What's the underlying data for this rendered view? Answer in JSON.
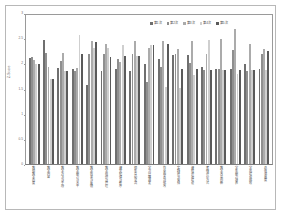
{
  "chart_data": {
    "type": "bar",
    "title": "",
    "subtitle": "",
    "xlabel": "",
    "ylabel": "Z-Score",
    "ylim": [
      0,
      3
    ],
    "yticks": [
      "0",
      "0.5",
      "1",
      "1.5",
      "2",
      "2.5",
      "3"
    ],
    "grid": false,
    "legend_position": "top-right",
    "series_colors": [
      "#6f6f6f",
      "#8f8f8f",
      "#ababab",
      "#cfcfcf",
      "#5a5a5a"
    ],
    "categories": [
      "教师教学态度",
      "教学内容",
      "教学方法与手段",
      "教学能力与水平",
      "教学效果与反馈",
      "教学组织与管理",
      "课堂纪律与秩序",
      "师生互动交流",
      "学习兴趣激发",
      "作业布置与批改",
      "实践环节安排",
      "课程资源建设",
      "考核评价方式",
      "教学改革创新",
      "学生能力培养",
      "学风建设成效",
      "总体满意度"
    ],
    "series": [
      {
        "name": "第1次",
        "values": [
          2.13,
          2.5,
          1.93,
          1.92,
          1.6,
          1.87,
          1.92,
          1.87,
          2.01,
          2.11,
          2.2,
          2.2,
          1.96,
          1.91,
          1.91,
          2.01,
          1.91
        ]
      },
      {
        "name": "第2次",
        "values": [
          2.16,
          2.24,
          2.07,
          1.87,
          2.21,
          2.21,
          2.12,
          2.21,
          1.66,
          1.96,
          2.21,
          2.04,
          1.9,
          1.91,
          2.29,
          1.88,
          2.22
        ]
      },
      {
        "name": "第3次",
        "values": [
          2.1,
          1.96,
          2.23,
          1.93,
          2.47,
          2.41,
          2.05,
          2.47,
          2.33,
          2.47,
          2.32,
          2.48,
          2.21,
          2.51,
          2.72,
          2.41,
          2.32
        ]
      },
      {
        "name": "第4次",
        "values": [
          2.01,
          1.71,
          1.88,
          2.59,
          2.34,
          2.34,
          2.39,
          2.17,
          2.39,
          1.56,
          1.54,
          1.8,
          2.5,
          1.9,
          1.81,
          1.9,
          1.9
        ]
      },
      {
        "name": "第5次",
        "values": [
          2.01,
          1.71,
          1.88,
          2.22,
          2.46,
          2.16,
          2.17,
          2.17,
          2.4,
          2.41,
          1.91,
          1.91,
          1.89,
          1.9,
          1.9,
          1.9,
          2.28
        ]
      }
    ]
  },
  "legend": {
    "items": [
      {
        "label": "第1次",
        "color": "#6f6f6f"
      },
      {
        "label": "第2次",
        "color": "#8f8f8f"
      },
      {
        "label": "第3次",
        "color": "#ababab"
      },
      {
        "label": "第4次",
        "color": "#cfcfcf"
      },
      {
        "label": "第5次",
        "color": "#5a5a5a"
      }
    ]
  },
  "axes": {
    "y_title": "Z-Score",
    "y_ticks": [
      "3",
      "2.5",
      "2",
      "1.5",
      "1",
      "0.5",
      "0"
    ]
  }
}
